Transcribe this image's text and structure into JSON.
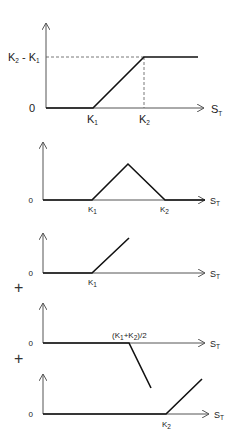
{
  "diagram": {
    "operators": [
      "+",
      "+"
    ],
    "panels": [
      {
        "id": "bull-spread",
        "y_labels": {
          "zero": "0",
          "top_main": "K",
          "top_sub2": "2",
          "top_sep": " - ",
          "top_main2": "K",
          "top_sub1": "1"
        },
        "x_labels": [
          {
            "main": "K",
            "sub": "1"
          },
          {
            "main": "K",
            "sub": "2"
          }
        ],
        "axis_label": {
          "main": "S",
          "sub": "T"
        }
      },
      {
        "id": "butterfly",
        "y_labels": {
          "zero": "0"
        },
        "x_labels": [
          {
            "main": "K",
            "sub": "1"
          },
          {
            "main": "K",
            "sub": "2"
          }
        ],
        "axis_label": {
          "main": "S",
          "sub": "T"
        }
      },
      {
        "id": "long-call-k1",
        "y_labels": {
          "zero": "0"
        },
        "x_labels": [
          {
            "main": "K",
            "sub": "1"
          }
        ],
        "axis_label": {
          "main": "S",
          "sub": "T"
        }
      },
      {
        "id": "short-two-calls-mid",
        "y_labels": {
          "zero": "0"
        },
        "x_labels": [
          {
            "open": "(K",
            "sub1": "1",
            "plus": "+K",
            "sub2": "2",
            "close": ")/2"
          }
        ],
        "axis_label": {
          "main": "S",
          "sub": "T"
        }
      },
      {
        "id": "long-call-k2",
        "y_labels": {
          "zero": "0"
        },
        "x_labels": [
          {
            "main": "K",
            "sub": "2"
          }
        ],
        "axis_label": {
          "main": "S",
          "sub": "T"
        }
      }
    ]
  }
}
